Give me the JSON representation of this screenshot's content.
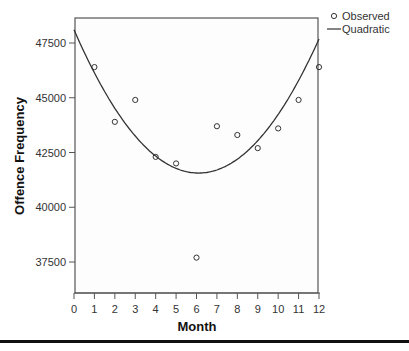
{
  "chart_data": {
    "type": "scatter",
    "title": "",
    "xlabel": "Month",
    "ylabel": "Offence Frequency",
    "xlim": [
      0,
      12.5
    ],
    "ylim": [
      36000,
      48600
    ],
    "x_ticks": [
      "0",
      "1",
      "2",
      "3",
      "4",
      "5",
      "6",
      "7",
      "8",
      "9",
      "10",
      "11",
      "12"
    ],
    "y_ticks": [
      "37500",
      "40000",
      "42500",
      "45000",
      "47500"
    ],
    "grid": false,
    "legend_position": "top-right outside",
    "legend": [
      "Observed",
      "Quadratic"
    ],
    "series": [
      {
        "name": "Observed",
        "kind": "points",
        "x": [
          1,
          2,
          3,
          4,
          5,
          6,
          7,
          8,
          9,
          10,
          11,
          12
        ],
        "values": [
          46400,
          43900,
          44900,
          42300,
          42000,
          37700,
          43700,
          43300,
          42700,
          43600,
          44900,
          46400
        ]
      },
      {
        "name": "Quadratic",
        "kind": "line",
        "vertex_x": 6.1,
        "vertex_y": 41560,
        "curvature": 176,
        "x": [
          0,
          1,
          2,
          3,
          4,
          5,
          6,
          7,
          8,
          9,
          10,
          11,
          12,
          12.5
        ],
        "values": [
          48110,
          46140,
          44520,
          43250,
          42340,
          41770,
          41560,
          41700,
          42200,
          43040,
          44240,
          45790,
          47700,
          48770
        ]
      }
    ]
  },
  "colors": {
    "line": "#333333",
    "marker": "#333333",
    "axis": "#555555",
    "rule": "#111111"
  }
}
